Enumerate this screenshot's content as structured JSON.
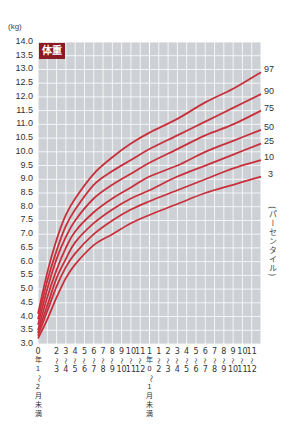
{
  "chart_data": {
    "type": "line",
    "title": "体重",
    "ylabel": "(kg)",
    "xlabel": "",
    "ylim": [
      3.0,
      14.0
    ],
    "xlim_months": [
      0,
      24
    ],
    "grid": true,
    "legend_position": "right",
    "legend_title": "(パーセンタイル)",
    "y_ticks": [
      "14.0",
      "13.5",
      "13.0",
      "12.5",
      "12.0",
      "11.5",
      "11.0",
      "10.5",
      "10.0",
      "9.5",
      "9.0",
      "8.5",
      "8.0",
      "7.5",
      "7.0",
      "6.5",
      "6.0",
      "5.5",
      "5.0",
      "4.5",
      "4.0",
      "3.5",
      "3.0"
    ],
    "x_tick_labels": [
      {
        "top": "0",
        "bottom": "年1〜2月未満",
        "vertical": true
      },
      {
        "top": "2",
        "bottom": "3"
      },
      {
        "top": "3",
        "bottom": "4"
      },
      {
        "top": "4",
        "bottom": "5"
      },
      {
        "top": "5",
        "bottom": "6"
      },
      {
        "top": "6",
        "bottom": "7"
      },
      {
        "top": "7",
        "bottom": "8"
      },
      {
        "top": "8",
        "bottom": "9"
      },
      {
        "top": "9",
        "bottom": "10"
      },
      {
        "top": "10",
        "bottom": "11"
      },
      {
        "top": "11",
        "bottom": "12"
      },
      {
        "top": "1",
        "bottom": "年0〜1月未満",
        "vertical": true
      },
      {
        "top": "1",
        "bottom": "2"
      },
      {
        "top": "2",
        "bottom": "3"
      },
      {
        "top": "3",
        "bottom": "4"
      },
      {
        "top": "4",
        "bottom": "5"
      },
      {
        "top": "5",
        "bottom": "6"
      },
      {
        "top": "6",
        "bottom": "7"
      },
      {
        "top": "7",
        "bottom": "8"
      },
      {
        "top": "8",
        "bottom": "9"
      },
      {
        "top": "9",
        "bottom": "10"
      },
      {
        "top": "10",
        "bottom": "11"
      },
      {
        "top": "11",
        "bottom": "12"
      }
    ],
    "x": [
      0,
      1,
      2,
      3,
      4,
      6,
      8,
      10,
      12,
      15,
      18,
      21,
      24
    ],
    "series": [
      {
        "name": "97",
        "values": [
          4.1,
          5.6,
          6.8,
          7.7,
          8.3,
          9.2,
          9.8,
          10.3,
          10.7,
          11.2,
          11.8,
          12.3,
          12.9
        ]
      },
      {
        "name": "90",
        "values": [
          3.9,
          5.3,
          6.4,
          7.3,
          7.9,
          8.8,
          9.3,
          9.7,
          10.1,
          10.6,
          11.1,
          11.6,
          12.1
        ]
      },
      {
        "name": "75",
        "values": [
          3.7,
          5.0,
          6.1,
          6.9,
          7.5,
          8.3,
          8.8,
          9.2,
          9.6,
          10.1,
          10.6,
          11.0,
          11.5
        ]
      },
      {
        "name": "50",
        "values": [
          3.5,
          4.7,
          5.7,
          6.5,
          7.1,
          7.8,
          8.3,
          8.7,
          9.1,
          9.5,
          10.0,
          10.4,
          10.8
        ]
      },
      {
        "name": "25",
        "values": [
          3.4,
          4.4,
          5.4,
          6.1,
          6.7,
          7.4,
          7.9,
          8.3,
          8.6,
          9.1,
          9.5,
          9.9,
          10.3
        ]
      },
      {
        "name": "10",
        "values": [
          3.3,
          4.2,
          5.1,
          5.8,
          6.3,
          7.0,
          7.5,
          7.9,
          8.2,
          8.6,
          9.0,
          9.4,
          9.7
        ]
      },
      {
        "name": "3",
        "values": [
          3.2,
          3.9,
          4.7,
          5.4,
          5.9,
          6.6,
          7.0,
          7.4,
          7.7,
          8.1,
          8.5,
          8.8,
          9.1
        ]
      }
    ],
    "colors": {
      "plot_bg": "#cdd0d4",
      "grid": "#ffffff",
      "curve": "#c8303c",
      "badge": "#8b1a22"
    }
  }
}
